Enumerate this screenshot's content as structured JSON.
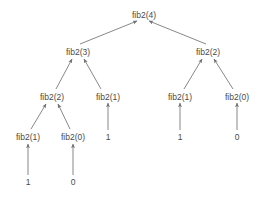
{
  "diagram": {
    "background_color": "#ffffff",
    "text_color": "#4a4a4a",
    "edge_color": "#7a7a7a",
    "nodes": [
      {
        "id": "n0",
        "label": "fib2(4)",
        "x": 144,
        "y": 14,
        "level": 0
      },
      {
        "id": "n1",
        "label": "fib2(3)",
        "x": 78,
        "y": 51,
        "level": 1
      },
      {
        "id": "n2",
        "label": "fib2(2)",
        "x": 208,
        "y": 51,
        "level": 1
      },
      {
        "id": "n3",
        "label": "fib2(2)",
        "x": 52,
        "y": 96,
        "level": 2
      },
      {
        "id": "n4",
        "label": "fib2(1)",
        "x": 108,
        "y": 96,
        "level": 2
      },
      {
        "id": "n5",
        "label": "fib2(1)",
        "x": 180,
        "y": 96,
        "level": 2
      },
      {
        "id": "n6",
        "label": "fib2(0)",
        "x": 237,
        "y": 96,
        "level": 2
      },
      {
        "id": "n7",
        "label": "fib2(1)",
        "x": 28,
        "y": 136,
        "level": 3
      },
      {
        "id": "n8",
        "label": "fib2(0)",
        "x": 73,
        "y": 136,
        "level": 3
      }
    ],
    "leaves": [
      {
        "id": "l0",
        "label": "1",
        "x": 108,
        "y": 136
      },
      {
        "id": "l1",
        "label": "1",
        "x": 180,
        "y": 136
      },
      {
        "id": "l2",
        "label": "0",
        "x": 237,
        "y": 136
      },
      {
        "id": "l3",
        "label": "1",
        "x": 28,
        "y": 181
      },
      {
        "id": "l4",
        "label": "0",
        "x": 73,
        "y": 181
      }
    ],
    "edges": [
      {
        "from": "fib2(3)",
        "to": "fib2(4)",
        "x1": 80,
        "y1": 44,
        "x2": 137,
        "y2": 21
      },
      {
        "from": "fib2(2)",
        "to": "fib2(4)",
        "x1": 206,
        "y1": 44,
        "x2": 149,
        "y2": 21
      },
      {
        "from": "fib2(2)",
        "to": "fib2(3)",
        "x1": 56,
        "y1": 89,
        "x2": 72,
        "y2": 59
      },
      {
        "from": "fib2(1)",
        "to": "fib2(3)",
        "x1": 101,
        "y1": 89,
        "x2": 84,
        "y2": 59
      },
      {
        "from": "fib2(1)",
        "to": "fib2(2)",
        "x1": 184,
        "y1": 89,
        "x2": 202,
        "y2": 59
      },
      {
        "from": "fib2(0)",
        "to": "fib2(2)",
        "x1": 233,
        "y1": 89,
        "x2": 214,
        "y2": 59
      },
      {
        "from": "fib2(1)",
        "to": "fib2(2)",
        "x1": 31,
        "y1": 129,
        "x2": 46,
        "y2": 104
      },
      {
        "from": "fib2(0)",
        "to": "fib2(2)",
        "x1": 70,
        "y1": 129,
        "x2": 58,
        "y2": 104
      },
      {
        "from": "1",
        "to": "fib2(1)",
        "x1": 108,
        "y1": 130,
        "x2": 108,
        "y2": 103
      },
      {
        "from": "1",
        "to": "fib2(1)",
        "x1": 180,
        "y1": 130,
        "x2": 180,
        "y2": 103
      },
      {
        "from": "0",
        "to": "fib2(0)",
        "x1": 237,
        "y1": 130,
        "x2": 237,
        "y2": 103
      },
      {
        "from": "1",
        "to": "fib2(1)",
        "x1": 28,
        "y1": 175,
        "x2": 28,
        "y2": 144
      },
      {
        "from": "0",
        "to": "fib2(0)",
        "x1": 73,
        "y1": 175,
        "x2": 73,
        "y2": 144
      }
    ]
  }
}
